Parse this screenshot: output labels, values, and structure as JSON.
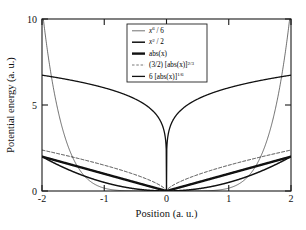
{
  "chart_data": {
    "type": "line",
    "title": "",
    "xlabel": "Position (a. u.)",
    "ylabel": "Potential energy (a. u.)",
    "xlim": [
      -2,
      2
    ],
    "ylim": [
      0,
      10
    ],
    "xticks": [
      -2,
      -1,
      0,
      1,
      2
    ],
    "xticklabels": [
      "-2",
      "-1",
      "0",
      "1",
      "2"
    ],
    "yticks": [
      0,
      5,
      10
    ],
    "yticklabels": [
      "0",
      "5",
      "10"
    ],
    "grid": false,
    "legend_position": "upper center",
    "x": [
      -2,
      -1.75,
      -1.5,
      -1.25,
      -1,
      -0.75,
      -0.5,
      -0.25,
      0,
      0.25,
      0.5,
      0.75,
      1,
      1.25,
      1.5,
      1.75,
      2
    ],
    "series": [
      {
        "name": "x^6 / 6",
        "label_plain": "x6 / 6",
        "formula": "|x|^6 / 6",
        "style": "thin-solid",
        "color": "#111111",
        "linewidth": 0.6,
        "values": [
          10.67,
          4.59,
          1.9,
          0.64,
          0.167,
          0.0297,
          0.0026,
          4e-05,
          0,
          4e-05,
          0.0026,
          0.0297,
          0.167,
          0.64,
          1.9,
          4.59,
          10.67
        ]
      },
      {
        "name": "x^2 / 2",
        "label_plain": "x2 / 2",
        "formula": "x^2 / 2",
        "style": "medium-solid",
        "color": "#111111",
        "linewidth": 1.5,
        "values": [
          2.0,
          1.531,
          1.125,
          0.781,
          0.5,
          0.281,
          0.125,
          0.031,
          0,
          0.031,
          0.125,
          0.281,
          0.5,
          0.781,
          1.125,
          1.531,
          2.0
        ]
      },
      {
        "name": "abs(x)",
        "label_plain": "abs(x)",
        "formula": "|x|",
        "style": "thick-solid",
        "color": "#111111",
        "linewidth": 2.4,
        "values": [
          2.0,
          1.75,
          1.5,
          1.25,
          1.0,
          0.75,
          0.5,
          0.25,
          0,
          0.25,
          0.5,
          0.75,
          1.0,
          1.25,
          1.5,
          1.75,
          2.0
        ]
      },
      {
        "name": "(3/2) [abs(x)]^(2/3)",
        "label_plain": "(3/2) [abs(x)]2/3",
        "formula": "1.5 * |x|^(2/3)",
        "style": "dashed",
        "color": "#555555",
        "linewidth": 0.8,
        "values": [
          2.381,
          2.177,
          1.964,
          1.741,
          1.5,
          1.238,
          0.945,
          0.595,
          0,
          0.595,
          0.945,
          1.238,
          1.5,
          1.741,
          1.964,
          2.177,
          2.381
        ]
      },
      {
        "name": "6 [abs(x)]^(1/6)",
        "label_plain": "6 [abs(x)]1/6",
        "formula": "6 * |x|^(1/6)",
        "style": "solid",
        "color": "#111111",
        "linewidth": 1.3,
        "values": [
          6.73,
          6.58,
          6.41,
          6.21,
          6.0,
          5.72,
          5.35,
          4.76,
          0,
          4.76,
          5.35,
          5.72,
          6.0,
          6.21,
          6.41,
          6.58,
          6.73
        ]
      }
    ],
    "legend": [
      {
        "id": "legend-entry-x6",
        "base": "x",
        "sup": "6",
        "rest": " / 6",
        "italic_base": true,
        "style": "thin-solid"
      },
      {
        "id": "legend-entry-x2",
        "base": "x",
        "sup": "2",
        "rest": " / 2",
        "italic_base": true,
        "style": "medium-solid"
      },
      {
        "id": "legend-entry-abs",
        "base": "abs(",
        "sup": "",
        "rest": "x)",
        "italic_base": false,
        "style": "thick-solid"
      },
      {
        "id": "legend-entry-pow23",
        "base": "(3/2) [abs(x)]",
        "sup": "2/3",
        "rest": "",
        "italic_base": false,
        "style": "dashed"
      },
      {
        "id": "legend-entry-pow16",
        "base": "6 [abs(x)]",
        "sup": "1/6",
        "rest": "",
        "italic_base": false,
        "style": "solid"
      }
    ]
  },
  "colors": {
    "background": "#ffffff",
    "axis": "#1a1a1a",
    "curve": "#111111",
    "dashed_curve": "#555555"
  }
}
